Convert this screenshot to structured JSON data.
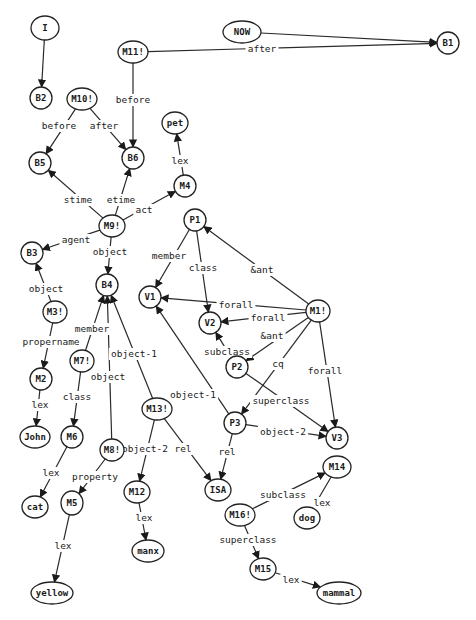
{
  "diagram": {
    "type": "semantic-network",
    "colors": {
      "stroke": "#222222",
      "text": "#1a1a1a",
      "background": "#ffffff"
    },
    "nodes": [
      {
        "id": "I",
        "label": "I",
        "x": 45,
        "y": 28,
        "rx": 14,
        "ry": 12
      },
      {
        "id": "NOW",
        "label": "NOW",
        "x": 242,
        "y": 32,
        "rx": 19,
        "ry": 11
      },
      {
        "id": "M11",
        "label": "M11!",
        "x": 133,
        "y": 52,
        "rx": 15,
        "ry": 11
      },
      {
        "id": "B1",
        "label": "B1",
        "x": 448,
        "y": 43,
        "rx": 11,
        "ry": 11
      },
      {
        "id": "B2",
        "label": "B2",
        "x": 41,
        "y": 98,
        "rx": 11,
        "ry": 11
      },
      {
        "id": "M10",
        "label": "M10!",
        "x": 82,
        "y": 99,
        "rx": 15,
        "ry": 11
      },
      {
        "id": "pet",
        "label": "pet",
        "x": 175,
        "y": 123,
        "rx": 13,
        "ry": 11
      },
      {
        "id": "B5",
        "label": "B5",
        "x": 40,
        "y": 163,
        "rx": 11,
        "ry": 11
      },
      {
        "id": "B6",
        "label": "B6",
        "x": 133,
        "y": 158,
        "rx": 11,
        "ry": 11
      },
      {
        "id": "M4",
        "label": "M4",
        "x": 185,
        "y": 186,
        "rx": 11,
        "ry": 11
      },
      {
        "id": "M9",
        "label": "M9!",
        "x": 112,
        "y": 226,
        "rx": 13,
        "ry": 11
      },
      {
        "id": "P1",
        "label": "P1",
        "x": 195,
        "y": 220,
        "rx": 11,
        "ry": 11
      },
      {
        "id": "B3",
        "label": "B3",
        "x": 32,
        "y": 253,
        "rx": 11,
        "ry": 11
      },
      {
        "id": "B4",
        "label": "B4",
        "x": 107,
        "y": 285,
        "rx": 11,
        "ry": 11
      },
      {
        "id": "V1",
        "label": "V1",
        "x": 150,
        "y": 297,
        "rx": 11,
        "ry": 11
      },
      {
        "id": "V2",
        "label": "V2",
        "x": 210,
        "y": 323,
        "rx": 11,
        "ry": 11
      },
      {
        "id": "M1",
        "label": "M1!",
        "x": 318,
        "y": 311,
        "rx": 12,
        "ry": 11
      },
      {
        "id": "M3",
        "label": "M3!",
        "x": 55,
        "y": 312,
        "rx": 12,
        "ry": 11
      },
      {
        "id": "P2",
        "label": "P2",
        "x": 237,
        "y": 367,
        "rx": 11,
        "ry": 11
      },
      {
        "id": "M7",
        "label": "M7!",
        "x": 82,
        "y": 361,
        "rx": 12,
        "ry": 11
      },
      {
        "id": "M2",
        "label": "M2",
        "x": 41,
        "y": 379,
        "rx": 11,
        "ry": 11
      },
      {
        "id": "M13",
        "label": "M13!",
        "x": 157,
        "y": 409,
        "rx": 15,
        "ry": 11
      },
      {
        "id": "P3",
        "label": "P3",
        "x": 235,
        "y": 423,
        "rx": 11,
        "ry": 11
      },
      {
        "id": "V3",
        "label": "V3",
        "x": 337,
        "y": 438,
        "rx": 11,
        "ry": 11
      },
      {
        "id": "John",
        "label": "John",
        "x": 35,
        "y": 437,
        "rx": 15,
        "ry": 11
      },
      {
        "id": "M6",
        "label": "M6",
        "x": 72,
        "y": 437,
        "rx": 11,
        "ry": 11
      },
      {
        "id": "M8",
        "label": "M8!",
        "x": 112,
        "y": 450,
        "rx": 12,
        "ry": 11
      },
      {
        "id": "M14",
        "label": "M14",
        "x": 337,
        "y": 467,
        "rx": 14,
        "ry": 11
      },
      {
        "id": "M12",
        "label": "M12",
        "x": 137,
        "y": 492,
        "rx": 13,
        "ry": 11
      },
      {
        "id": "ISA",
        "label": "ISA",
        "x": 218,
        "y": 490,
        "rx": 13,
        "ry": 11
      },
      {
        "id": "cat",
        "label": "cat",
        "x": 35,
        "y": 507,
        "rx": 13,
        "ry": 11
      },
      {
        "id": "M5",
        "label": "M5",
        "x": 72,
        "y": 503,
        "rx": 11,
        "ry": 12
      },
      {
        "id": "M16",
        "label": "M16!",
        "x": 240,
        "y": 515,
        "rx": 15,
        "ry": 11
      },
      {
        "id": "dog",
        "label": "dog",
        "x": 307,
        "y": 518,
        "rx": 13,
        "ry": 11
      },
      {
        "id": "manx",
        "label": "manx",
        "x": 148,
        "y": 551,
        "rx": 16,
        "ry": 11
      },
      {
        "id": "M15",
        "label": "M15",
        "x": 263,
        "y": 569,
        "rx": 13,
        "ry": 11
      },
      {
        "id": "yellow",
        "label": "yellow",
        "x": 52,
        "y": 593,
        "rx": 21,
        "ry": 11
      },
      {
        "id": "mammal",
        "label": "mammal",
        "x": 339,
        "y": 593,
        "rx": 22,
        "ry": 11
      }
    ],
    "edges": [
      {
        "from": "I",
        "to": "B2",
        "label": "",
        "lx": 0,
        "ly": 0
      },
      {
        "from": "NOW",
        "to": "B1",
        "label": "",
        "lx": 0,
        "ly": 0
      },
      {
        "from": "M11",
        "to": "B1",
        "label": "after",
        "lx": 262,
        "ly": 49
      },
      {
        "from": "M11",
        "to": "B6",
        "label": "before",
        "lx": 133,
        "ly": 100
      },
      {
        "from": "M10",
        "to": "B5",
        "label": "before",
        "lx": 59,
        "ly": 126
      },
      {
        "from": "M10",
        "to": "B6",
        "label": "after",
        "lx": 104,
        "ly": 126
      },
      {
        "from": "M4",
        "to": "pet",
        "label": "lex",
        "lx": 180,
        "ly": 161
      },
      {
        "from": "M9",
        "to": "B5",
        "label": "stime",
        "lx": 78,
        "ly": 200
      },
      {
        "from": "M9",
        "to": "B6",
        "label": "etime",
        "lx": 121,
        "ly": 200
      },
      {
        "from": "M9",
        "to": "M4",
        "label": "act",
        "lx": 144,
        "ly": 210
      },
      {
        "from": "M9",
        "to": "B3",
        "label": "agent",
        "lx": 76,
        "ly": 240
      },
      {
        "from": "M9",
        "to": "B4",
        "label": "object",
        "lx": 110,
        "ly": 252
      },
      {
        "from": "M3",
        "to": "B3",
        "label": "object",
        "lx": 46,
        "ly": 289
      },
      {
        "from": "M3",
        "to": "M2",
        "label": "propername",
        "lx": 51,
        "ly": 342
      },
      {
        "from": "M2",
        "to": "John",
        "label": "lex",
        "lx": 40,
        "ly": 405
      },
      {
        "from": "M7",
        "to": "B4",
        "label": "member",
        "lx": 92,
        "ly": 329
      },
      {
        "from": "M7",
        "to": "M6",
        "label": "class",
        "lx": 77,
        "ly": 397
      },
      {
        "from": "M6",
        "to": "cat",
        "label": "lex",
        "lx": 51,
        "ly": 473
      },
      {
        "from": "M8",
        "to": "B4",
        "label": "object",
        "lx": 108,
        "ly": 377
      },
      {
        "from": "M8",
        "to": "M5",
        "label": "property",
        "lx": 95,
        "ly": 477
      },
      {
        "from": "M5",
        "to": "yellow",
        "label": "lex",
        "lx": 63,
        "ly": 546
      },
      {
        "from": "M13",
        "to": "B4",
        "label": "object-1",
        "lx": 134,
        "ly": 354
      },
      {
        "from": "M13",
        "to": "M12",
        "label": "object-2",
        "lx": 145,
        "ly": 449
      },
      {
        "from": "M13",
        "to": "ISA",
        "label": "rel",
        "lx": 183,
        "ly": 449
      },
      {
        "from": "M12",
        "to": "manx",
        "label": "lex",
        "lx": 144,
        "ly": 518
      },
      {
        "from": "P1",
        "to": "V1",
        "label": "member",
        "lx": 169,
        "ly": 256
      },
      {
        "from": "P1",
        "to": "V2",
        "label": "class",
        "lx": 203,
        "ly": 268
      },
      {
        "from": "M1",
        "to": "P1",
        "label": "&ant",
        "lx": 262,
        "ly": 270
      },
      {
        "from": "M1",
        "to": "V1",
        "label": "forall",
        "lx": 236,
        "ly": 305
      },
      {
        "from": "M1",
        "to": "V2",
        "label": "forall",
        "lx": 268,
        "ly": 318
      },
      {
        "from": "M1",
        "to": "P2",
        "label": "&ant",
        "lx": 272,
        "ly": 336
      },
      {
        "from": "M1",
        "to": "P3",
        "label": "cq",
        "lx": 278,
        "ly": 364
      },
      {
        "from": "M1",
        "to": "V3",
        "label": "forall",
        "lx": 325,
        "ly": 371
      },
      {
        "from": "P2",
        "to": "V2",
        "label": "subclass",
        "lx": 227,
        "ly": 352
      },
      {
        "from": "P2",
        "to": "V3",
        "label": "superclass",
        "lx": 281,
        "ly": 401
      },
      {
        "from": "P3",
        "to": "V1",
        "label": "object-1",
        "lx": 193,
        "ly": 395
      },
      {
        "from": "P3",
        "to": "V3",
        "label": "object-2",
        "lx": 283,
        "ly": 432
      },
      {
        "from": "P3",
        "to": "ISA",
        "label": "rel",
        "lx": 227,
        "ly": 452
      },
      {
        "from": "M16",
        "to": "M14",
        "label": "subclass",
        "lx": 283,
        "ly": 495
      },
      {
        "from": "M16",
        "to": "M15",
        "label": "superclass",
        "lx": 248,
        "ly": 540
      },
      {
        "from": "M14",
        "to": "dog",
        "label": "lex",
        "lx": 322,
        "ly": 503
      },
      {
        "from": "M15",
        "to": "mammal",
        "label": "lex",
        "lx": 291,
        "ly": 580
      }
    ]
  }
}
